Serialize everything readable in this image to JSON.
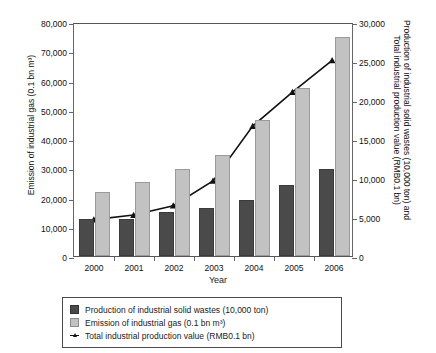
{
  "chart_data": {
    "type": "bar",
    "title": "",
    "xlabel": "Year",
    "ylabel": "Emission of industrial gas (0.1 bn m3)",
    "y2label_line1": "Production of industrial solid wastes (10,000 ton) and",
    "y2label_line2": "Total industrial production value (RMB0.1 bn)",
    "categories": [
      "2000",
      "2001",
      "2002",
      "2003",
      "2004",
      "2005",
      "2006"
    ],
    "ylim": [
      0,
      80000
    ],
    "y2lim": [
      0,
      30000
    ],
    "yticks": [
      "0",
      "10,000",
      "20,000",
      "30,000",
      "40,000",
      "50,000",
      "60,000",
      "70,000",
      "80,000"
    ],
    "ytick_values": [
      0,
      10000,
      20000,
      30000,
      40000,
      50000,
      60000,
      70000,
      80000
    ],
    "y2ticks": [
      "0",
      "5,000",
      "10,000",
      "15,000",
      "20,000",
      "25,000",
      "30,000"
    ],
    "y2tick_values": [
      0,
      5000,
      10000,
      15000,
      20000,
      25000,
      30000
    ],
    "grid": false,
    "legend_position": "below",
    "series": [
      {
        "name": "Production of industrial solid wastes (10,000 ton)",
        "kind": "bar",
        "axis": "right",
        "color": "#4a4a4a",
        "values": [
          4800,
          4700,
          5600,
          6100,
          7200,
          9100,
          11200
        ]
      },
      {
        "name": "Emission of industrial gas (0.1 bn m3)",
        "kind": "bar",
        "axis": "left",
        "color": "#c2c2c2",
        "values": [
          21800,
          25200,
          29700,
          34400,
          46500,
          57300,
          75000
        ]
      },
      {
        "name": "Total industrial production value (RMB0.1 bn)",
        "kind": "line",
        "axis": "right",
        "color": "#111111",
        "marker": "triangle",
        "values": [
          4700,
          5300,
          6500,
          9700,
          16800,
          21200,
          25300
        ]
      }
    ]
  },
  "legend": {
    "items": [
      {
        "label": "Production of industrial solid wastes (10,000 ton)",
        "swatch": "dark-square-swatch"
      },
      {
        "label": "Emission of industrial gas (0.1 bn m³)",
        "swatch": "light-square-swatch"
      },
      {
        "label": "Total industrial production value (RMB0.1 bn)",
        "swatch": "line-marker-swatch"
      }
    ]
  },
  "axes": {
    "x_title": "Year",
    "y_left_title": "Emission of industrial gas (0.1 bn m³)",
    "y_right_title_line1": "Production of industrial solid wastes (10,000 ton) and",
    "y_right_title_line2": "Total industrial production value (RMB0.1 bn)"
  }
}
